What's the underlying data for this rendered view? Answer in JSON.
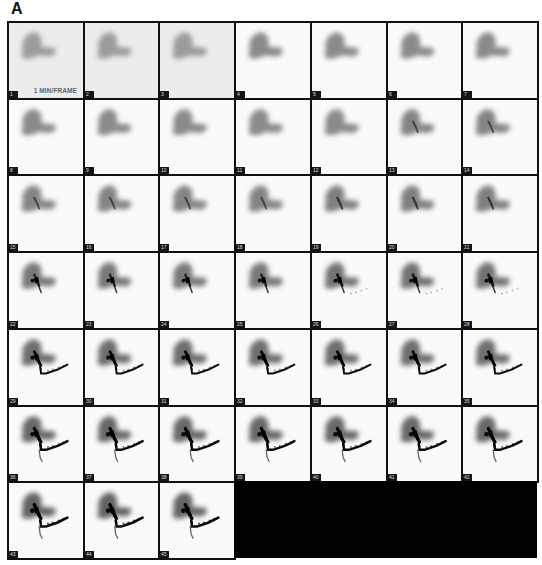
{
  "figure": {
    "panel_label": "A",
    "frame_rate_label": "1 MIN/FRAME",
    "grid": {
      "columns": 7,
      "rows": 7,
      "frame_count": 45
    },
    "frames": [
      {
        "n": "1",
        "stage": 0
      },
      {
        "n": "2",
        "stage": 0
      },
      {
        "n": "3",
        "stage": 0
      },
      {
        "n": "4",
        "stage": 1
      },
      {
        "n": "5",
        "stage": 1
      },
      {
        "n": "6",
        "stage": 1
      },
      {
        "n": "7",
        "stage": 1
      },
      {
        "n": "8",
        "stage": 1
      },
      {
        "n": "9",
        "stage": 1
      },
      {
        "n": "10",
        "stage": 1
      },
      {
        "n": "11",
        "stage": 1
      },
      {
        "n": "12",
        "stage": 1
      },
      {
        "n": "13",
        "stage": 2
      },
      {
        "n": "14",
        "stage": 2
      },
      {
        "n": "15",
        "stage": 2
      },
      {
        "n": "16",
        "stage": 2
      },
      {
        "n": "17",
        "stage": 2
      },
      {
        "n": "18",
        "stage": 2
      },
      {
        "n": "19",
        "stage": 3
      },
      {
        "n": "20",
        "stage": 3
      },
      {
        "n": "21",
        "stage": 3
      },
      {
        "n": "22",
        "stage": 4
      },
      {
        "n": "23",
        "stage": 4
      },
      {
        "n": "24",
        "stage": 4
      },
      {
        "n": "25",
        "stage": 4
      },
      {
        "n": "26",
        "stage": 5
      },
      {
        "n": "27",
        "stage": 5
      },
      {
        "n": "28",
        "stage": 5
      },
      {
        "n": "29",
        "stage": 6
      },
      {
        "n": "30",
        "stage": 6
      },
      {
        "n": "31",
        "stage": 6
      },
      {
        "n": "32",
        "stage": 6
      },
      {
        "n": "33",
        "stage": 6
      },
      {
        "n": "34",
        "stage": 6
      },
      {
        "n": "35",
        "stage": 6
      },
      {
        "n": "36",
        "stage": 7
      },
      {
        "n": "37",
        "stage": 7
      },
      {
        "n": "38",
        "stage": 7
      },
      {
        "n": "39",
        "stage": 7
      },
      {
        "n": "40",
        "stage": 7
      },
      {
        "n": "41",
        "stage": 7
      },
      {
        "n": "42",
        "stage": 7
      },
      {
        "n": "43",
        "stage": 8
      },
      {
        "n": "44",
        "stage": 8
      },
      {
        "n": "45",
        "stage": 8
      }
    ]
  },
  "colors": {
    "border": "#111111",
    "frame_background": "#fafafa",
    "early_frame_background": "#ececec",
    "filler": "#000000"
  }
}
